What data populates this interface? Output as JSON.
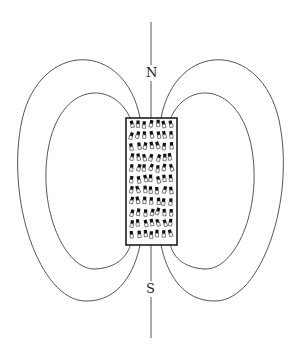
{
  "diagram": {
    "labels": {
      "north": "N",
      "south": "S"
    },
    "colors": {
      "line": "#555555",
      "magnet_outline": "#111111",
      "domain_fill": "#111111",
      "background": "#ffffff"
    },
    "magnet": {
      "x": 126,
      "y": 118,
      "width": 51,
      "height": 127
    },
    "axis": {
      "x": 151,
      "y1": 22,
      "y2": 338
    },
    "field_lines": [
      {
        "side": "left",
        "loop": "outer",
        "leftmost_x": 16,
        "top_y": 61,
        "bottom_y": 301
      },
      {
        "side": "left",
        "loop": "inner",
        "leftmost_x": 45,
        "top_y": 93,
        "bottom_y": 269
      },
      {
        "side": "right",
        "loop": "inner",
        "rightmost_x": 256,
        "top_y": 93,
        "bottom_y": 269
      },
      {
        "side": "right",
        "loop": "outer",
        "rightmost_x": 285,
        "top_y": 61,
        "bottom_y": 301
      }
    ],
    "domains": {
      "columns": 7,
      "rows": 11,
      "description": "small dipoles, dark end toward N"
    }
  }
}
